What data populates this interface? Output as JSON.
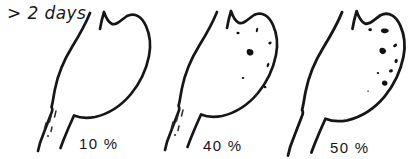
{
  "figure": {
    "kind": "hand-drawn stomach retention diagram",
    "annotation": {
      "duration_label": "> 2 days"
    },
    "panels": [
      {
        "id": "stomach-1",
        "retention_label": "10 %",
        "particles": "few small dashes in pyloric canal only"
      },
      {
        "id": "stomach-2",
        "retention_label": "40 %",
        "particles": "scattered small particles in fundus and body, few dashes in pyloric canal"
      },
      {
        "id": "stomach-3",
        "retention_label": "50 %",
        "particles": "numerous large dark particles in fundus and body"
      }
    ],
    "colors": {
      "ink": "#161616",
      "background": "#ffffff"
    }
  }
}
